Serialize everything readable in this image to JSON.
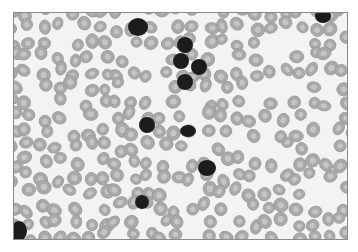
{
  "image": {
    "subject": "blood smear micrograph",
    "background_color": "#f3f3f3",
    "border_color": "#8a8a8a",
    "rbc_fill": "#a9a9a9",
    "rbc_rim": "#9a9a9a",
    "rbc_center": "#d2d2d2",
    "nucleus_color": "#1c1c1c"
  },
  "nucleated_cells": [
    {
      "x": 124,
      "y": 14,
      "rx": 10,
      "ry": 9
    },
    {
      "x": 171,
      "y": 32,
      "rx": 8,
      "ry": 8
    },
    {
      "x": 167,
      "y": 48,
      "rx": 8,
      "ry": 8
    },
    {
      "x": 185,
      "y": 54,
      "rx": 8,
      "ry": 8
    },
    {
      "x": 171,
      "y": 69,
      "rx": 8,
      "ry": 8
    },
    {
      "x": 133,
      "y": 112,
      "rx": 8,
      "ry": 8
    },
    {
      "x": 174,
      "y": 118,
      "rx": 8,
      "ry": 6
    },
    {
      "x": 193,
      "y": 155,
      "rx": 9,
      "ry": 8
    },
    {
      "x": 128,
      "y": 189,
      "rx": 7,
      "ry": 7
    },
    {
      "x": 309,
      "y": 3,
      "rx": 8,
      "ry": 7
    },
    {
      "x": 5,
      "y": 218,
      "rx": 8,
      "ry": 10
    }
  ]
}
